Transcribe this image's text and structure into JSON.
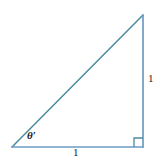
{
  "figure": {
    "kind": "right-triangle-diagram",
    "background_color": "#ffffff",
    "hypotenuse_color": "#4a8ba0",
    "leg_color": "#6b9bc3",
    "label_color": "#1a1a1a",
    "stroke_width": 1.4,
    "vertices": {
      "left": {
        "x": 12,
        "y": 147
      },
      "bottom_right": {
        "x": 143,
        "y": 147
      },
      "apex": {
        "x": 143,
        "y": 15
      }
    },
    "right_angle_marker": {
      "present": true,
      "size": 9,
      "corner": "bottom-right"
    },
    "labels": {
      "angle": "θ′",
      "vertical_side": "1",
      "horizontal_side": "1"
    }
  }
}
